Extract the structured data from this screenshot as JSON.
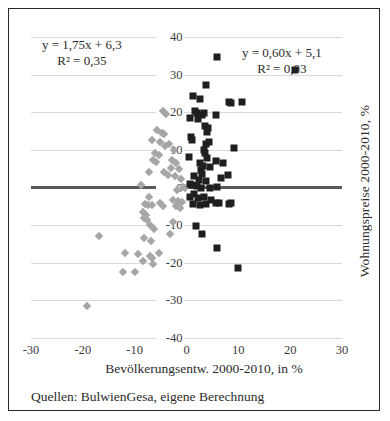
{
  "chart_data": {
    "type": "scatter",
    "title": "",
    "xlabel": "Bevölkerungsentw. 2000-2010, in %",
    "ylabel": "Wohnungspreise 2000-2010, %",
    "xlim": [
      -30,
      30
    ],
    "ylim": [
      -40,
      40
    ],
    "xticks": [
      -30,
      -20,
      -10,
      0,
      10,
      20,
      30
    ],
    "yticks": [
      40,
      30,
      20,
      10,
      0,
      -10,
      -20,
      -30,
      -40
    ],
    "xtick_labels": [
      "-30",
      "-20",
      "-10",
      "0",
      "10",
      "20",
      "30"
    ],
    "ytick_labels": [
      "40",
      "30",
      "20",
      "10",
      "0",
      "-10",
      "-20",
      "-30",
      "-40"
    ],
    "grid": "horizontal",
    "legend": "none",
    "zero_line": 0,
    "annotations": [
      {
        "id": "left-fit",
        "line1": "y = 1,75x + 6,3",
        "line2": "R² = 0,35",
        "series": "Westdeutschland (grau)"
      },
      {
        "id": "right-fit",
        "line1": "y = 0,60x + 5,1",
        "line2": "R² = 0,03",
        "series": "Ostdeutschland (schwarz)"
      }
    ],
    "series": [
      {
        "name": "Serie A (graue Rauten)",
        "marker": "diamond",
        "color": "#a6a6a6",
        "points": [
          [
            -4.6,
            20.4
          ],
          [
            -4.0,
            19.6
          ],
          [
            -5.6,
            15.4
          ],
          [
            -4.8,
            14.6
          ],
          [
            -4.4,
            14.2
          ],
          [
            -6.6,
            12.6
          ],
          [
            -5.2,
            12.2
          ],
          [
            -3.4,
            11.6
          ],
          [
            -4.2,
            11.0
          ],
          [
            -2.4,
            10.0
          ],
          [
            -6.0,
            9.2
          ],
          [
            -5.4,
            8.6
          ],
          [
            -6.4,
            7.4
          ],
          [
            -5.8,
            6.8
          ],
          [
            -2.8,
            7.4
          ],
          [
            -2.0,
            6.6
          ],
          [
            -3.0,
            5.2
          ],
          [
            -1.4,
            5.0
          ],
          [
            -7.2,
            4.2
          ],
          [
            -4.4,
            4.0
          ],
          [
            -3.6,
            3.4
          ],
          [
            -2.2,
            3.0
          ],
          [
            -1.0,
            2.2
          ],
          [
            -8.8,
            0.6
          ],
          [
            -0.6,
            0.2
          ],
          [
            -0.2,
            0.0
          ],
          [
            -1.8,
            -0.6
          ],
          [
            -7.2,
            -2.4
          ],
          [
            -2.6,
            -3.2
          ],
          [
            -1.6,
            -3.6
          ],
          [
            -0.8,
            -3.8
          ],
          [
            -8.0,
            -4.4
          ],
          [
            -7.4,
            -4.6
          ],
          [
            -6.6,
            -4.6
          ],
          [
            -5.2,
            -4.2
          ],
          [
            -4.6,
            -4.8
          ],
          [
            -2.0,
            -5.0
          ],
          [
            -1.2,
            -5.4
          ],
          [
            -8.4,
            -6.6
          ],
          [
            -7.8,
            -7.2
          ],
          [
            -8.2,
            -8.0
          ],
          [
            -7.6,
            -8.6
          ],
          [
            -2.6,
            -9.2
          ],
          [
            -7.0,
            -10.0
          ],
          [
            -6.2,
            -11.0
          ],
          [
            -3.2,
            -12.4
          ],
          [
            -16.8,
            -12.8
          ],
          [
            -8.2,
            -13.4
          ],
          [
            -6.8,
            -14.2
          ],
          [
            -11.8,
            -17.4
          ],
          [
            -9.4,
            -17.6
          ],
          [
            -5.4,
            -17.4
          ],
          [
            -7.0,
            -18.2
          ],
          [
            -6.6,
            -18.8
          ],
          [
            -8.4,
            -19.6
          ],
          [
            -6.4,
            -20.2
          ],
          [
            -12.2,
            -22.4
          ],
          [
            -10.0,
            -22.4
          ],
          [
            -19.2,
            -31.4
          ]
        ]
      },
      {
        "name": "Serie B (schwarze Quadrate)",
        "marker": "square",
        "color": "#1f1f1f",
        "points": [
          [
            5.8,
            34.6
          ],
          [
            21.0,
            31.2
          ],
          [
            3.8,
            27.2
          ],
          [
            1.2,
            24.4
          ],
          [
            2.6,
            23.6
          ],
          [
            8.2,
            22.6
          ],
          [
            10.8,
            22.8
          ],
          [
            8.6,
            22.4
          ],
          [
            1.6,
            20.2
          ],
          [
            2.0,
            19.8
          ],
          [
            3.0,
            19.4
          ],
          [
            3.4,
            19.8
          ],
          [
            5.6,
            19.4
          ],
          [
            0.6,
            18.6
          ],
          [
            2.2,
            18.2
          ],
          [
            3.6,
            16.4
          ],
          [
            4.2,
            15.8
          ],
          [
            4.0,
            14.8
          ],
          [
            0.8,
            13.4
          ],
          [
            1.0,
            12.6
          ],
          [
            4.4,
            12.2
          ],
          [
            3.8,
            11.6
          ],
          [
            9.2,
            10.4
          ],
          [
            3.4,
            10.0
          ],
          [
            3.6,
            9.2
          ],
          [
            0.4,
            8.2
          ],
          [
            4.0,
            7.8
          ],
          [
            5.6,
            7.0
          ],
          [
            2.6,
            6.6
          ],
          [
            7.0,
            6.4
          ],
          [
            3.2,
            5.6
          ],
          [
            4.6,
            5.4
          ],
          [
            2.8,
            4.6
          ],
          [
            8.0,
            3.4
          ],
          [
            3.0,
            3.6
          ],
          [
            1.4,
            3.0
          ],
          [
            6.6,
            2.6
          ],
          [
            2.4,
            2.0
          ],
          [
            3.8,
            1.8
          ],
          [
            0.6,
            1.0
          ],
          [
            1.0,
            0.6
          ],
          [
            2.0,
            0.4
          ],
          [
            5.8,
            0.2
          ],
          [
            2.8,
            0.0
          ],
          [
            4.6,
            -0.2
          ],
          [
            1.4,
            -1.6
          ],
          [
            0.6,
            -2.4
          ],
          [
            2.2,
            -2.8
          ],
          [
            3.4,
            -2.6
          ],
          [
            4.8,
            -3.4
          ],
          [
            1.2,
            -4.4
          ],
          [
            2.6,
            -4.6
          ],
          [
            3.8,
            -4.4
          ],
          [
            5.6,
            -4.2
          ],
          [
            6.2,
            -4.0
          ],
          [
            8.2,
            -4.4
          ],
          [
            8.6,
            -4.2
          ],
          [
            1.8,
            -10.2
          ],
          [
            3.0,
            -12.4
          ],
          [
            5.8,
            -16.0
          ],
          [
            10.0,
            -21.4
          ]
        ]
      }
    ],
    "source_note": "Quellen: BulwienGesa, eigene Berechnung"
  }
}
